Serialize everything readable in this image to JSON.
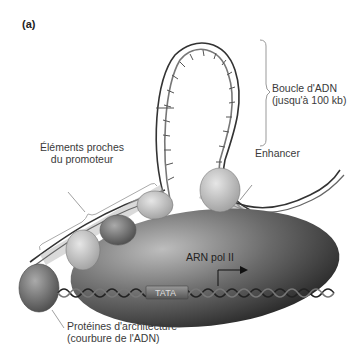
{
  "panel_label": "(a)",
  "labels": {
    "loop_line1": "Boucle d'ADN",
    "loop_line2": "(jusqu'à 100 kb)",
    "enhancer": "Enhancer",
    "proximal_line1": "Éléments proches",
    "proximal_line2": "du promoteur",
    "polymerase": "ARN pol II",
    "tata": "TATA",
    "architecture_line1": "Protéines d'architecture",
    "architecture_line2": "(courbure de l'ADN)"
  }
}
